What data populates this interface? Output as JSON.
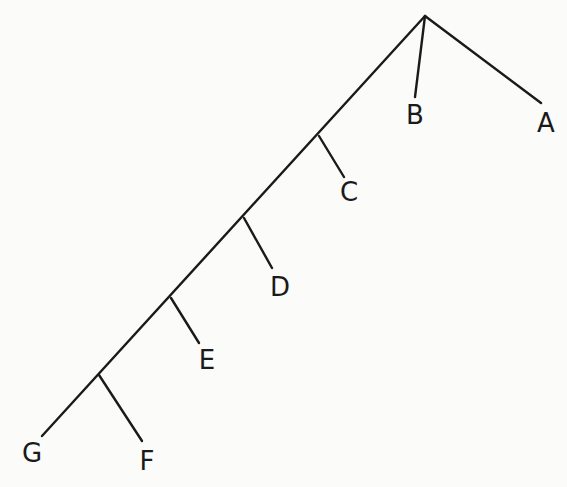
{
  "diagram": {
    "type": "cladogram",
    "canvas": {
      "width": 567,
      "height": 487,
      "background": "#fbfbfa"
    },
    "stroke_color": "#1a1a1a",
    "root": {
      "x": 425,
      "y": 16
    },
    "edges": [
      {
        "id": "trunk",
        "from": [
          425,
          16
        ],
        "to": [
          42,
          436
        ]
      },
      {
        "id": "branch-a",
        "from": [
          425,
          16
        ],
        "to": [
          541,
          103
        ]
      },
      {
        "id": "branch-b",
        "from": [
          425,
          16
        ],
        "to": [
          415,
          97
        ]
      },
      {
        "id": "branch-c",
        "from": [
          319,
          136
        ],
        "to": [
          344,
          177
        ]
      },
      {
        "id": "branch-d",
        "from": [
          244,
          218
        ],
        "to": [
          272,
          268
        ]
      },
      {
        "id": "branch-e",
        "from": [
          171,
          298
        ],
        "to": [
          199,
          343
        ]
      },
      {
        "id": "branch-f",
        "from": [
          99,
          375
        ],
        "to": [
          142,
          441
        ]
      }
    ],
    "leaves": [
      {
        "id": "A",
        "label": "A",
        "x": 546,
        "y": 123
      },
      {
        "id": "B",
        "label": "B",
        "x": 415,
        "y": 115
      },
      {
        "id": "C",
        "label": "C",
        "x": 349,
        "y": 192
      },
      {
        "id": "D",
        "label": "D",
        "x": 280,
        "y": 287
      },
      {
        "id": "E",
        "label": "E",
        "x": 207,
        "y": 360
      },
      {
        "id": "F",
        "label": "F",
        "x": 147,
        "y": 461
      },
      {
        "id": "G",
        "label": "G",
        "x": 32,
        "y": 453
      }
    ]
  }
}
